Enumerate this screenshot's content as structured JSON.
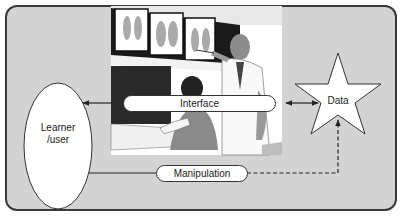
{
  "diagram": {
    "nodes": {
      "learner": {
        "label_line1": "Learner",
        "label_line2": "/user",
        "shape": "ellipse"
      },
      "interface": {
        "label": "Interface",
        "shape": "pill"
      },
      "data": {
        "label": "Data",
        "shape": "star"
      },
      "manipulation": {
        "label": "Manipulation",
        "shape": "pill"
      }
    },
    "edges": [
      {
        "from": "interface",
        "to": "learner",
        "style": "solid",
        "arrow": "end"
      },
      {
        "from": "interface",
        "to": "data",
        "style": "solid",
        "arrow": "both"
      },
      {
        "from": "learner",
        "to": "manipulation",
        "style": "solid",
        "arrow": "none"
      },
      {
        "from": "manipulation",
        "to": "data",
        "style": "dashed",
        "arrow": "end"
      }
    ],
    "illustration": "radiology-lightbox-scene",
    "colors": {
      "frame_fill": "#d3d3d3",
      "frame_border": "#3a3a3a",
      "node_fill": "#ffffff",
      "line": "#222222"
    }
  }
}
